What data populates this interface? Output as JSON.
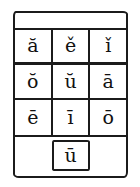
{
  "figure": {
    "kind": "vowel-diacritic-grid",
    "header_strip_text": "",
    "ink_color": "#1b1b1b",
    "background_color": "#ffffff"
  },
  "grid": {
    "rows": [
      {
        "row_label": "row-1",
        "cells": [
          {
            "glyph": "ă",
            "base_letter": "a",
            "diacritic": "breve"
          },
          {
            "glyph": "ě",
            "base_letter": "e",
            "diacritic": "caron"
          },
          {
            "glyph": "ǐ",
            "base_letter": "i",
            "diacritic": "caron"
          }
        ]
      },
      {
        "row_label": "row-2",
        "cells": [
          {
            "glyph": "ŏ",
            "base_letter": "o",
            "diacritic": "breve"
          },
          {
            "glyph": "ŭ",
            "base_letter": "u",
            "diacritic": "breve"
          },
          {
            "glyph": "ā",
            "base_letter": "a",
            "diacritic": "macron"
          }
        ]
      },
      {
        "row_label": "row-3",
        "cells": [
          {
            "glyph": "ē",
            "base_letter": "e",
            "diacritic": "macron"
          },
          {
            "glyph": "ī",
            "base_letter": "i",
            "diacritic": "macron"
          },
          {
            "glyph": "ō",
            "base_letter": "o",
            "diacritic": "macron"
          }
        ]
      }
    ],
    "footer_cell": {
      "glyph": "ū",
      "base_letter": "u",
      "diacritic": "macron"
    }
  }
}
